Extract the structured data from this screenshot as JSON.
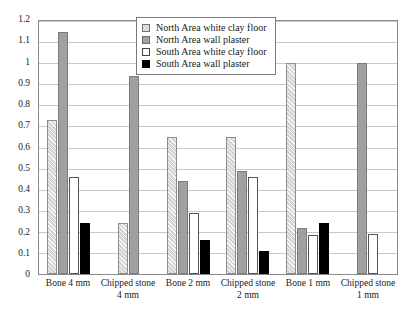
{
  "chart_data": {
    "type": "bar",
    "title": "",
    "xlabel": "",
    "ylabel": "",
    "ylim": [
      0,
      1.2
    ],
    "ytick_step": 0.1,
    "grid": true,
    "legend_position": "top-center",
    "categories": [
      "Bone 4 mm",
      "Chipped stone 4 mm",
      "Bone 2 mm",
      "Chipped stone 2 mm",
      "Bone 1 mm",
      "Chipped stone 1 mm"
    ],
    "ytick_labels": [
      "1.2",
      "1.1",
      "1",
      "0.9",
      "0.8",
      "0.7",
      "0.6",
      "0.5",
      "0.4",
      "0.3",
      "0.2",
      "0.1",
      "0"
    ],
    "ytick_values": [
      1.2,
      1.1,
      1.0,
      0.9,
      0.8,
      0.7,
      0.6,
      0.5,
      0.4,
      0.3,
      0.2,
      0.1,
      0
    ],
    "series": [
      {
        "name": "North Area white clay floor",
        "color": "#d4d4d4",
        "pattern": "diagonal-hatch",
        "values": [
          0.73,
          0.24,
          0.65,
          0.65,
          1.0,
          0
        ]
      },
      {
        "name": "North Area wall plaster",
        "color": "#a0a0a0",
        "pattern": "solid",
        "values": [
          1.15,
          0.94,
          0.44,
          0.49,
          0.22,
          1.0
        ]
      },
      {
        "name": "South Area white clay floor",
        "color": "#ffffff",
        "pattern": "solid",
        "values": [
          0.46,
          0,
          0.29,
          0.46,
          0.185,
          0.19
        ]
      },
      {
        "name": "South Area wall plaster",
        "color": "#000000",
        "pattern": "solid",
        "values": [
          0.24,
          0,
          0.16,
          0.11,
          0.24,
          0
        ]
      }
    ]
  }
}
